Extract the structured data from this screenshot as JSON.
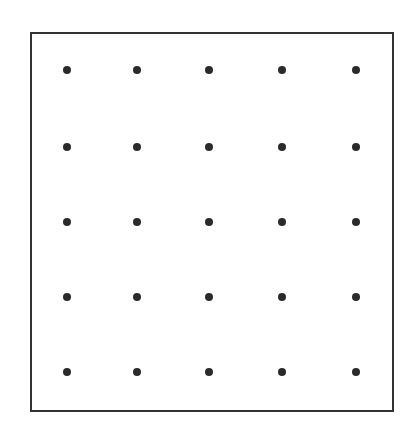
{
  "diagram": {
    "frame": {
      "left": 30,
      "top": 32,
      "right": 392,
      "bottom": 410,
      "stroke": "#333333"
    },
    "dot_color": "#2a2a2a",
    "rows": 5,
    "cols": 5,
    "col_x": [
      67,
      137,
      209,
      282,
      356
    ],
    "row_y": [
      70,
      147,
      222,
      297,
      372
    ]
  }
}
